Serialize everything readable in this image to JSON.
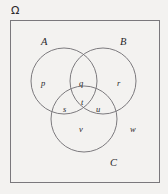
{
  "figure": {
    "kind": "venn-diagram",
    "background_color": "#f3f2f0",
    "stroke_color": "#6e6c70",
    "text_color": "#29272a"
  },
  "universe": {
    "symbol": "Ω",
    "name": "omega-universal-set-label",
    "x": 11,
    "y": 5
  },
  "universe_box": {
    "x": 10,
    "y": 20,
    "width": 149,
    "height": 162,
    "stroke": "#7a787c"
  },
  "circles": [
    {
      "id": "A",
      "cx": 64,
      "cy": 81,
      "r": 33
    },
    {
      "id": "B",
      "cx": 103,
      "cy": 81,
      "r": 33
    },
    {
      "id": "C",
      "cx": 84,
      "cy": 119,
      "r": 33
    }
  ],
  "set_labels": [
    {
      "id": "A",
      "text": "A",
      "x": 41,
      "y": 37
    },
    {
      "id": "B",
      "text": "B",
      "x": 120,
      "y": 37
    },
    {
      "id": "C",
      "text": "C",
      "x": 110,
      "y": 158
    }
  ],
  "region_labels": [
    {
      "id": "p",
      "text": "p",
      "x": 41,
      "y": 79
    },
    {
      "id": "q",
      "text": "q",
      "x": 79,
      "y": 79
    },
    {
      "id": "r",
      "text": "r",
      "x": 117,
      "y": 79
    },
    {
      "id": "s",
      "text": "s",
      "x": 63,
      "y": 105
    },
    {
      "id": "t",
      "text": "t",
      "x": 81,
      "y": 98
    },
    {
      "id": "u",
      "text": "u",
      "x": 96,
      "y": 105
    },
    {
      "id": "v",
      "text": "v",
      "x": 79,
      "y": 125
    },
    {
      "id": "w",
      "text": "w",
      "x": 130,
      "y": 125
    }
  ]
}
